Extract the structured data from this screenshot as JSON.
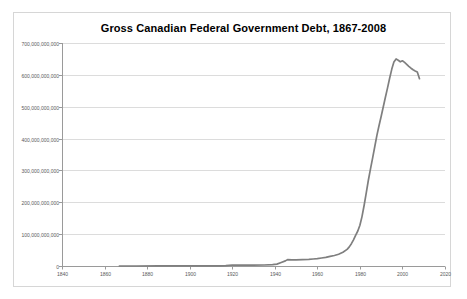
{
  "chart_data": {
    "type": "line",
    "title": "Gross Canadian Federal Government Debt, 1867-2008",
    "xlabel": "",
    "ylabel": "",
    "legend": "none",
    "grid": "horizontal",
    "xlim": [
      1840,
      2020
    ],
    "ylim_billions": [
      0,
      700
    ],
    "xticks": [
      1840,
      1860,
      1880,
      1900,
      1920,
      1940,
      1960,
      1980,
      2000,
      2020
    ],
    "yticks_billions": [
      0,
      100,
      200,
      300,
      400,
      500,
      600,
      700
    ],
    "ytick_labels": [
      "0",
      "100,000,000,000",
      "200,000,000,000",
      "300,000,000,000",
      "400,000,000,000",
      "500,000,000,000",
      "600,000,000,000",
      "700,000,000,000"
    ],
    "series_name": "Gross federal government debt ($)",
    "x": [
      1867,
      1875,
      1885,
      1895,
      1905,
      1913,
      1915,
      1917,
      1920,
      1925,
      1930,
      1935,
      1939,
      1941,
      1943,
      1945,
      1946,
      1948,
      1950,
      1953,
      1956,
      1958,
      1960,
      1962,
      1964,
      1966,
      1968,
      1970,
      1972,
      1974,
      1975,
      1976,
      1977,
      1978,
      1979,
      1980,
      1981,
      1982,
      1983,
      1984,
      1985,
      1986,
      1987,
      1988,
      1989,
      1990,
      1991,
      1992,
      1993,
      1994,
      1995,
      1996,
      1997,
      1998,
      1999,
      2000,
      2001,
      2002,
      2003,
      2004,
      2005,
      2006,
      2007,
      2008
    ],
    "values_billions": [
      0.1,
      0.15,
      0.25,
      0.3,
      0.35,
      0.5,
      0.7,
      1.2,
      3.0,
      2.7,
      2.5,
      3.2,
      4.0,
      6,
      11,
      16,
      20,
      19,
      19,
      20,
      21,
      22,
      23,
      25,
      27,
      30,
      33,
      37,
      43,
      52,
      60,
      70,
      82,
      96,
      110,
      128,
      155,
      190,
      230,
      270,
      305,
      340,
      375,
      410,
      440,
      470,
      500,
      530,
      560,
      590,
      618,
      640,
      650,
      646,
      641,
      644,
      639,
      633,
      627,
      621,
      616,
      612,
      609,
      588
    ],
    "colors": {
      "line": "#7f7f7f",
      "gridline": "#dcdcdc",
      "axis": "#9a9a9a",
      "tick_label": "#595959",
      "title": "#000000",
      "frame_border": "#d6d6d6",
      "background": "#ffffff"
    }
  }
}
